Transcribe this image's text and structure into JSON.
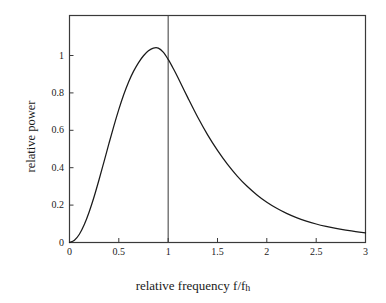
{
  "figure": {
    "background_color": "#ffffff",
    "frame_color": "#3a3a3a",
    "curve_color": "#1a1a1a",
    "marker_line_color": "#4a4a4a"
  },
  "axis_titles": {
    "x_main": "relative frequency f/f",
    "x_sub": "h",
    "y": "relative power"
  },
  "chart_data": {
    "type": "line",
    "title": "",
    "subtitle": "",
    "xlabel": "relative frequency f/fh",
    "ylabel": "relative power",
    "xlim": [
      0,
      3
    ],
    "ylim": [
      0,
      1.24
    ],
    "grid": false,
    "legend": null,
    "frame": "box",
    "xticks": [
      0,
      0.5,
      1,
      1.5,
      2,
      2.5,
      3
    ],
    "xtick_labels": [
      "0",
      "0.5",
      "1",
      "1.5",
      "2",
      "2.5",
      "3"
    ],
    "yticks": [
      0,
      0.2,
      0.4,
      0.6,
      0.8,
      1
    ],
    "ytick_labels": [
      "0",
      "0.2",
      "0.4",
      "0.6",
      "0.8",
      "1"
    ],
    "annotations": [
      {
        "name": "unity-frequency-marker",
        "type": "vline",
        "x": 1,
        "label": ""
      }
    ],
    "series": [
      {
        "name": "relative power",
        "x": [
          0,
          0.05,
          0.1,
          0.15,
          0.2,
          0.25,
          0.3,
          0.35,
          0.4,
          0.45,
          0.5,
          0.55,
          0.6,
          0.65,
          0.7,
          0.75,
          0.8,
          0.85,
          0.9,
          0.95,
          1,
          1.05,
          1.1,
          1.2,
          1.3,
          1.4,
          1.5,
          1.6,
          1.7,
          1.8,
          1.9,
          2,
          2.1,
          2.2,
          2.3,
          2.4,
          2.5,
          2.6,
          2.7,
          2.8,
          2.9,
          3
        ],
        "values": [
          0,
          0.012,
          0.045,
          0.098,
          0.168,
          0.251,
          0.344,
          0.442,
          0.541,
          0.637,
          0.727,
          0.808,
          0.878,
          0.936,
          0.983,
          1.02,
          1.047,
          1.062,
          1.062,
          1.04,
          1.0,
          0.952,
          0.9,
          0.79,
          0.684,
          0.588,
          0.503,
          0.428,
          0.363,
          0.307,
          0.26,
          0.22,
          0.187,
          0.159,
          0.136,
          0.117,
          0.101,
          0.088,
          0.077,
          0.068,
          0.06,
          0.052
        ]
      }
    ],
    "peak": {
      "x": 0.82,
      "y": 1.065
    },
    "value_at_unity": 1.0
  }
}
